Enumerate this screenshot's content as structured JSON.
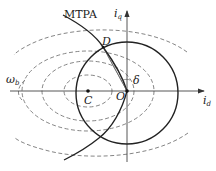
{
  "diagram": {
    "type": "motor current vector diagram (d-q plane)",
    "labels": {
      "mtpa": "MTPA",
      "point_d": "D",
      "point_c": "C",
      "origin": "O",
      "angle": "δ",
      "omega_main": "ω",
      "omega_sub": "b",
      "iq_main": "i",
      "iq_sub": "q",
      "id_main": "i",
      "id_sub": "d"
    },
    "colors": {
      "solid_curve": "#222222",
      "dashed_curve": "#777777",
      "axis": "#444444"
    },
    "elements": {
      "current_limit_circle": {
        "style": "solid",
        "center": "O"
      },
      "voltage_limit_ellipses": {
        "style": "dashed",
        "center": "C",
        "count": 4
      },
      "mtpa_curve": {
        "style": "solid",
        "passes_through": [
          "D",
          "O"
        ]
      },
      "current_vector": {
        "from": "O",
        "to": "D",
        "angle_label": "δ"
      }
    }
  }
}
